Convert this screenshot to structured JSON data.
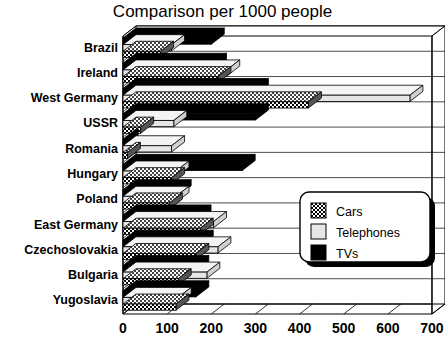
{
  "chart_data": {
    "type": "bar",
    "orientation": "horizontal",
    "title": "Comparison per 1000 people",
    "xlabel": "",
    "ylabel": "",
    "xlim": [
      0,
      700
    ],
    "xticks": [
      0,
      100,
      200,
      300,
      400,
      500,
      600,
      700
    ],
    "xtick_labels": [
      "0",
      "100",
      "200",
      "300",
      "400",
      "500",
      "600",
      "700"
    ],
    "grid": true,
    "legend_position": "center-right",
    "style": "3d-ribbon",
    "categories": [
      "Brazil",
      "Ireland",
      "West Germany",
      "USSR",
      "Romania",
      "Hungary",
      "Poland",
      "East Germany",
      "Czechoslovakia",
      "Bulgaria",
      "Yugoslavia"
    ],
    "series": [
      {
        "name": "Cars",
        "color": "#808080",
        "pattern": "checker",
        "values": [
          85,
          215,
          420,
          40,
          10,
          110,
          105,
          175,
          165,
          125,
          120
        ]
      },
      {
        "name": "Telephones",
        "color": "#e8e8e8",
        "pattern": "solid-light",
        "values": [
          110,
          235,
          650,
          115,
          110,
          120,
          120,
          205,
          215,
          190,
          125
        ]
      },
      {
        "name": "TVs",
        "color": "#000000",
        "pattern": "solid-dark",
        "values": [
          200,
          205,
          300,
          300,
          5,
          270,
          125,
          170,
          175,
          165,
          165
        ]
      }
    ],
    "legend": [
      "Cars",
      "Telephones",
      "TVs"
    ]
  }
}
